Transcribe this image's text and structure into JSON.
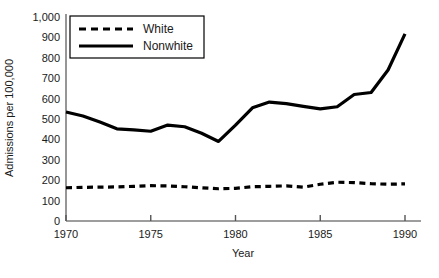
{
  "chart_data": {
    "type": "line",
    "title": "",
    "xlabel": "Year",
    "ylabel": "Admissions per 100,000",
    "xlim": [
      1970,
      1990
    ],
    "ylim": [
      0,
      1000
    ],
    "xticks": [
      1970,
      1975,
      1980,
      1985,
      1990
    ],
    "xticklabels": [
      "1970",
      "1975",
      "1980",
      "1985",
      "1990"
    ],
    "yticks": [
      0,
      100,
      200,
      300,
      400,
      500,
      600,
      700,
      800,
      900,
      1000
    ],
    "yticklabels": [
      "0",
      "100",
      "200",
      "300",
      "400",
      "500",
      "600",
      "700",
      "800",
      "900",
      "1,000"
    ],
    "grid": false,
    "legend_position": "upper-left-inside",
    "x": [
      1970,
      1971,
      1972,
      1973,
      1974,
      1975,
      1976,
      1977,
      1978,
      1979,
      1980,
      1981,
      1982,
      1983,
      1984,
      1985,
      1986,
      1987,
      1988,
      1989,
      1990
    ],
    "series": [
      {
        "name": "White",
        "style": "dashed",
        "values": [
          163,
          165,
          166,
          167,
          170,
          173,
          172,
          168,
          163,
          158,
          160,
          168,
          170,
          172,
          166,
          180,
          190,
          188,
          183,
          180,
          182
        ]
      },
      {
        "name": "Nonwhite",
        "style": "solid",
        "values": [
          534,
          515,
          485,
          452,
          447,
          440,
          470,
          462,
          430,
          390,
          470,
          555,
          583,
          575,
          562,
          550,
          560,
          620,
          630,
          740,
          917
        ]
      }
    ],
    "legend": [
      {
        "label": "White",
        "style": "dashed"
      },
      {
        "label": "Nonwhite",
        "style": "solid"
      }
    ]
  }
}
